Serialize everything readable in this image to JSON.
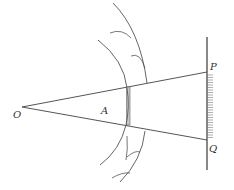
{
  "diagram": {
    "labels": {
      "O": "O",
      "A": "A",
      "P": "P",
      "Q": "Q"
    },
    "colors": {
      "line": "#555555",
      "slit_fill": "#c8c8c8",
      "background": "#ffffff"
    },
    "points": {
      "O": [
        22,
        107
      ],
      "P": [
        206,
        72
      ],
      "Q": [
        206,
        140
      ]
    }
  }
}
